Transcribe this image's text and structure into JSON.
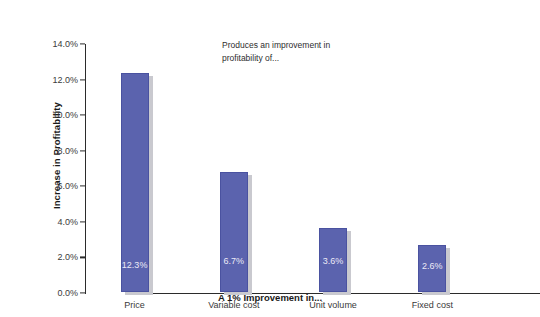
{
  "chart_data": {
    "type": "bar",
    "title": "",
    "subtitle": "",
    "categories": [
      "Price",
      "Variable cost",
      "Unit volume",
      "Fixed cost"
    ],
    "values": [
      12.3,
      6.7,
      3.6,
      2.6
    ],
    "data_labels": [
      "12.3%",
      "6.7%",
      "3.6%",
      "2.6%"
    ],
    "xlabel": "A 1% Improvement in...",
    "ylabel": "Increase in Profitability",
    "ylim": [
      0,
      14
    ],
    "ytick_values": [
      0,
      2,
      4,
      6,
      8,
      10,
      12,
      14
    ],
    "ytick_labels": [
      "0.0%",
      "2.0%",
      "4.0%",
      "6.0%",
      "8.0%",
      "10.0%",
      "12.0%",
      "14.0%"
    ],
    "grid": false,
    "legend": null,
    "annotations": [
      {
        "text": "Produces an improvement in\nprofitability of...",
        "x": 222,
        "y": 39
      }
    ],
    "series_color": "#5b63ae",
    "shadow_color": "#c9c9cf",
    "background_color": "#ffffff",
    "axis_color": "#2b2b2b",
    "label_text_color": "#eceaf6"
  }
}
